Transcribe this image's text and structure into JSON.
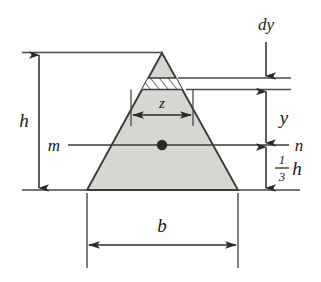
{
  "figure": {
    "shape": "triangle",
    "fill_color": "#d6d4cf",
    "stroke_color": "#3a3a3a",
    "background_color": "#ffffff",
    "labels": {
      "height": "h",
      "base": "b",
      "strip_width": "z",
      "strip_thickness": "dy",
      "distance_to_strip": "y",
      "centroid_height_numerator": "1",
      "centroid_height_denominator": "3",
      "centroid_height_symbol": "h",
      "axis_left": "m",
      "axis_right": "n"
    },
    "geometry": {
      "apex_x": 162,
      "apex_y": 53,
      "base_left_x": 87,
      "base_right_x": 238,
      "base_y": 190,
      "centroid_axis_y": 145,
      "strip_top_y": 78,
      "strip_bottom_y": 89,
      "centroid_dot_x": 162,
      "centroid_dot_y": 145
    },
    "annotations": [
      {
        "name": "h-dimension",
        "text": "h",
        "orientation": "vertical",
        "side": "left"
      },
      {
        "name": "b-dimension",
        "text": "b",
        "orientation": "horizontal",
        "side": "bottom"
      },
      {
        "name": "z-dimension",
        "text": "z",
        "orientation": "horizontal",
        "side": "interior"
      },
      {
        "name": "dy-dimension",
        "text": "dy",
        "orientation": "vertical",
        "side": "right-top"
      },
      {
        "name": "y-dimension",
        "text": "y",
        "orientation": "vertical",
        "side": "right"
      },
      {
        "name": "third-h-dimension",
        "text": "1/3 h",
        "orientation": "vertical",
        "side": "right-bottom"
      }
    ]
  }
}
